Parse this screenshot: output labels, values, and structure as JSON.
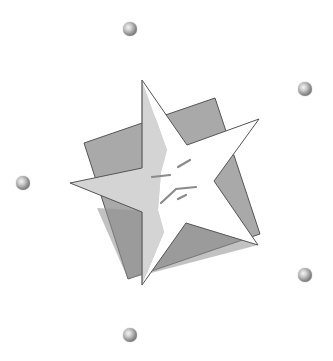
{
  "image": {
    "description": "Grayscale clip-art: white five-point star overlapping a tilted gray square, surrounded by six small gray spheres",
    "colors": {
      "background": "#ffffff",
      "square_fill": "#a9a9a9",
      "square_shadow": "#8f8f8f",
      "star_light": "#ffffff",
      "star_shade": "#d2d2d2",
      "outline": "#555555",
      "sparkle": "#8a8a8a"
    }
  },
  "spheres": [
    {
      "name": "sphere-top",
      "x": 123,
      "y": 22
    },
    {
      "name": "sphere-right-upper",
      "x": 298,
      "y": 82
    },
    {
      "name": "sphere-left",
      "x": 16,
      "y": 176
    },
    {
      "name": "sphere-right-lower",
      "x": 298,
      "y": 268
    },
    {
      "name": "sphere-bottom",
      "x": 123,
      "y": 328
    }
  ]
}
